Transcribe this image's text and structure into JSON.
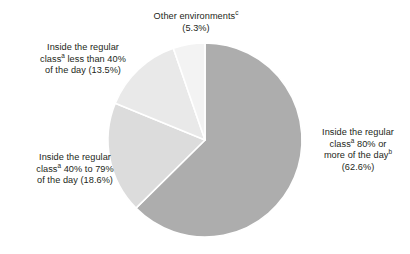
{
  "chart_data": {
    "type": "pie",
    "title": "",
    "subtitle": "",
    "xlabel": "",
    "ylabel": "",
    "legend_position": "none",
    "grid": false,
    "labels_position": "outside-callout",
    "start_angle_deg": 0,
    "direction": "clockwise",
    "categories": [
      "Inside the regular classᵃ 80% or more of the dayᵇ",
      "Inside the regular classᵃ 40% to 79% of the day",
      "Inside the regular classᵃ less than 40% of the day",
      "Other environmentsᶜ"
    ],
    "values": [
      62.6,
      18.6,
      13.5,
      5.3
    ],
    "value_labels": [
      "(62.6%)",
      "(18.6%)",
      "(13.5%)",
      "(5.3%)"
    ],
    "colors": [
      "#adadad",
      "#dcdcdc",
      "#e9e9e9",
      "#f3f3f3"
    ],
    "slice_separator_color": "#ffffff",
    "units": "percent"
  },
  "pie": {
    "center_x": 205,
    "center_y": 140,
    "radius": 97,
    "slices": [
      {
        "name": "inside-regular-class-80-or-more",
        "percent": 62.6,
        "color": "#adadad",
        "start_deg": 0,
        "sweep_deg": 225.36
      },
      {
        "name": "inside-regular-class-40-to-79",
        "percent": 18.6,
        "color": "#dcdcdc",
        "start_deg": 225.36,
        "sweep_deg": 66.96
      },
      {
        "name": "inside-regular-class-less-than-40",
        "percent": 13.5,
        "color": "#e9e9e9",
        "start_deg": 292.32,
        "sweep_deg": 48.6
      },
      {
        "name": "other-environments",
        "percent": 5.3,
        "color": "#f3f3f3",
        "start_deg": 340.92,
        "sweep_deg": 19.08
      }
    ]
  },
  "labels": {
    "other_environments": {
      "line1": "Other environments",
      "sup1": "c",
      "line2": "(5.3%)"
    },
    "less_than_40": {
      "line1": "Inside the regular",
      "line2a": "class",
      "sup2": "a",
      "line2b": " less than 40%",
      "line3": "of the day (13.5%)"
    },
    "forty_to_79": {
      "line1": "Inside the regular",
      "line2a": "class",
      "sup2": "a",
      "line2b": " 40% to 79%",
      "line3": "of the day (18.6%)"
    },
    "eighty_or_more": {
      "line1": "Inside the regular",
      "line2a": "class",
      "sup2": "a",
      "line2b": " 80% or",
      "line3a": "more of the day",
      "sup3": "b",
      "line4": "(62.6%)"
    }
  }
}
